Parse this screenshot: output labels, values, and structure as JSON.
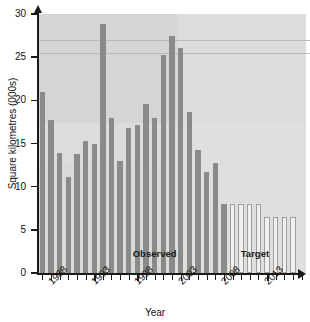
{
  "chart_data": {
    "type": "bar",
    "title": "",
    "xlabel": "Year",
    "ylabel": "Square kilometres (000s)",
    "ylim": [
      0,
      30
    ],
    "yticks": [
      0,
      5,
      10,
      15,
      20,
      25,
      30
    ],
    "ytick_labels": [
      "0",
      "5",
      "10",
      "15",
      "20",
      "25",
      "30"
    ],
    "xlim": [
      1986.5,
      2017.5
    ],
    "xtick_labels": [
      "1988",
      "1993",
      "1998",
      "2003",
      "2008",
      "2013"
    ],
    "xtick_values": [
      1988,
      1993,
      1998,
      2003,
      2008,
      2013
    ],
    "grid": false,
    "legend": "none",
    "reference_lines": [
      27.0,
      25.5
    ],
    "annotations": [
      {
        "text": "Observed",
        "x": 2000,
        "y": 2.2
      },
      {
        "text": "Target",
        "x": 2012.5,
        "y": 2.2
      }
    ],
    "categories": [
      1987,
      1988,
      1989,
      1990,
      1991,
      1992,
      1993,
      1994,
      1995,
      1996,
      1997,
      1998,
      1999,
      2000,
      2001,
      2002,
      2003,
      2004,
      2005,
      2006,
      2007,
      2008,
      2009,
      2010,
      2011,
      2012,
      2013,
      2014,
      2015,
      2016
    ],
    "series": [
      {
        "name": "Observed",
        "style": "filled-grey",
        "values": [
          21.0,
          17.7,
          13.9,
          11.1,
          13.8,
          15.3,
          14.9,
          28.8,
          18.0,
          13.0,
          16.8,
          17.1,
          19.6,
          18.0,
          25.2,
          27.4,
          26.1,
          18.6,
          14.2,
          11.7,
          12.8,
          8.0,
          null,
          null,
          null,
          null,
          null,
          null,
          null,
          null
        ]
      },
      {
        "name": "Target",
        "style": "outlined-white",
        "values": [
          null,
          null,
          null,
          null,
          null,
          null,
          null,
          null,
          null,
          null,
          null,
          null,
          null,
          null,
          null,
          null,
          null,
          null,
          null,
          null,
          null,
          null,
          8.0,
          8.0,
          8.0,
          8.0,
          6.5,
          6.5,
          6.5,
          6.5
        ]
      }
    ]
  },
  "colors": {
    "plot_background": "#dcdcda",
    "observed_bar": "#8a8a88",
    "target_bar_fill": "#f0f0ee",
    "target_bar_stroke": "#9d9d9b",
    "axis": "#1a1a1a",
    "reference_line": "#b9b9b7"
  }
}
